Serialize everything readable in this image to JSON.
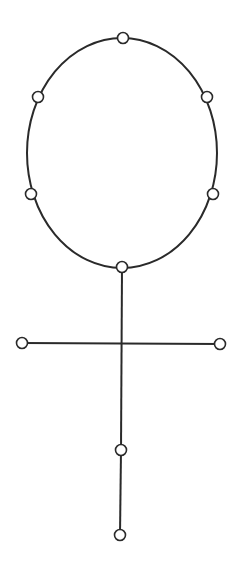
{
  "diagram": {
    "type": "graph",
    "colors": {
      "background": "#ffffff",
      "stroke": "#2a2a2a",
      "node_fill": "#ffffff"
    },
    "ring": {
      "cx": 122,
      "cy": 153,
      "rx": 95,
      "ry": 115
    },
    "node_radius": 5.5,
    "nodes": [
      {
        "id": "ring-top",
        "x": 123,
        "y": 38
      },
      {
        "id": "ring-upper-left",
        "x": 38,
        "y": 97
      },
      {
        "id": "ring-upper-right",
        "x": 207,
        "y": 97
      },
      {
        "id": "ring-lower-left",
        "x": 31,
        "y": 194
      },
      {
        "id": "ring-lower-right",
        "x": 213,
        "y": 194
      },
      {
        "id": "ring-bottom",
        "x": 122,
        "y": 267
      },
      {
        "id": "crossbar-left",
        "x": 22,
        "y": 343
      },
      {
        "id": "crossbar-right",
        "x": 220,
        "y": 344
      },
      {
        "id": "stem-middle",
        "x": 121,
        "y": 450
      },
      {
        "id": "stem-bottom",
        "x": 120,
        "y": 535
      }
    ],
    "edges": [
      {
        "from": "ring-bottom",
        "to": "stem-middle",
        "x1": 122,
        "y1": 267,
        "x2": 121,
        "y2": 450
      },
      {
        "from": "stem-middle",
        "to": "stem-bottom",
        "x1": 121,
        "y1": 450,
        "x2": 120,
        "y2": 535
      },
      {
        "from": "crossbar-left",
        "to": "crossbar-right",
        "x1": 22,
        "y1": 343,
        "x2": 220,
        "y2": 344
      }
    ]
  }
}
